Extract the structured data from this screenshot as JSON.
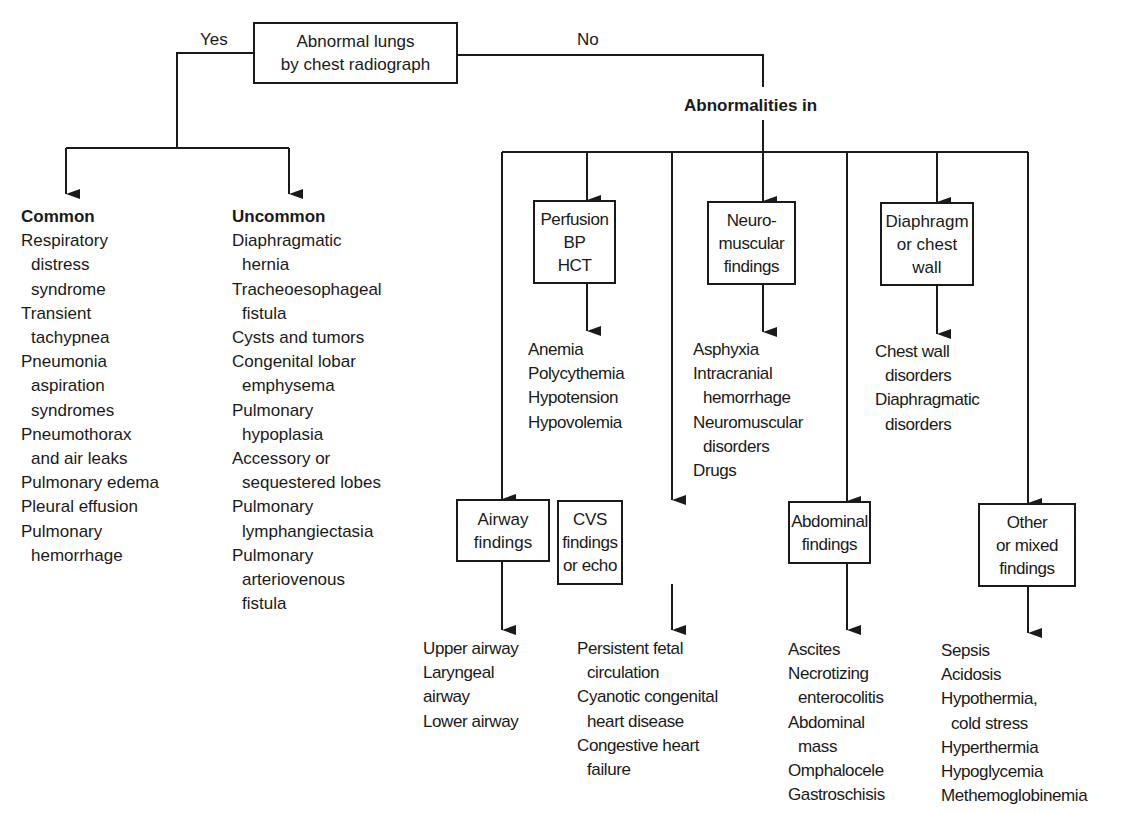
{
  "root": {
    "label_lines": [
      "Abnormal lungs",
      "by chest radiograph"
    ],
    "yes_label": "Yes",
    "no_label": "No"
  },
  "yes_branch": {
    "common": {
      "heading": "Common",
      "items": [
        {
          "main": "Respiratory",
          "cont": [
            "distress",
            "syndrome"
          ]
        },
        {
          "main": "Transient",
          "cont": [
            "tachypnea"
          ]
        },
        {
          "main": "Pneumonia",
          "cont": [
            "aspiration",
            "syndromes"
          ]
        },
        {
          "main": "Pneumothorax",
          "cont": [
            "and air leaks"
          ]
        },
        {
          "main": "Pulmonary edema",
          "cont": []
        },
        {
          "main": "Pleural effusion",
          "cont": []
        },
        {
          "main": "Pulmonary",
          "cont": [
            "hemorrhage"
          ]
        }
      ]
    },
    "uncommon": {
      "heading": "Uncommon",
      "items": [
        {
          "main": "Diaphragmatic",
          "cont": [
            "hernia"
          ]
        },
        {
          "main": "Tracheoesophageal",
          "cont": [
            "fistula"
          ]
        },
        {
          "main": "Cysts and tumors",
          "cont": []
        },
        {
          "main": "Congenital lobar",
          "cont": [
            "emphysema"
          ]
        },
        {
          "main": "Pulmonary",
          "cont": [
            "hypoplasia"
          ]
        },
        {
          "main": "Accessory or",
          "cont": [
            "sequestered lobes"
          ]
        },
        {
          "main": "Pulmonary",
          "cont": [
            "lymphangiectasia"
          ]
        },
        {
          "main": "Pulmonary",
          "cont": [
            "arteriovenous",
            "fistula"
          ]
        }
      ]
    }
  },
  "no_branch": {
    "heading": "Abnormalities in",
    "categories": [
      {
        "id": "perfusion",
        "box_lines": [
          "Perfusion",
          "BP",
          "HCT"
        ],
        "items": [
          {
            "main": "Anemia",
            "cont": []
          },
          {
            "main": "Polycythemia",
            "cont": []
          },
          {
            "main": "Hypotension",
            "cont": []
          },
          {
            "main": "Hypovolemia",
            "cont": []
          }
        ]
      },
      {
        "id": "neuromuscular",
        "box_lines": [
          "Neuro-",
          "muscular",
          "findings"
        ],
        "items": [
          {
            "main": "Asphyxia",
            "cont": []
          },
          {
            "main": "Intracranial",
            "cont": [
              "hemorrhage"
            ]
          },
          {
            "main": "Neuromuscular",
            "cont": [
              "disorders"
            ]
          },
          {
            "main": "Drugs",
            "cont": []
          }
        ]
      },
      {
        "id": "diaphragm",
        "box_lines": [
          "Diaphragm",
          "or chest",
          "wall"
        ],
        "items": [
          {
            "main": "Chest wall",
            "cont": [
              "disorders"
            ]
          },
          {
            "main": "Diaphragmatic",
            "cont": [
              "disorders"
            ]
          }
        ]
      },
      {
        "id": "airway",
        "box_lines": [
          "Airway",
          "findings"
        ],
        "items": [
          {
            "main": "Upper airway",
            "cont": []
          },
          {
            "main": "Laryngeal",
            "cont": []
          },
          {
            "main": "airway",
            "cont": []
          },
          {
            "main": "Lower airway",
            "cont": []
          }
        ]
      },
      {
        "id": "cvs",
        "box_lines": [
          "CVS",
          "findings",
          "or echo"
        ],
        "items": [
          {
            "main": "Persistent fetal",
            "cont": [
              "circulation"
            ]
          },
          {
            "main": "Cyanotic congenital",
            "cont": [
              "heart disease"
            ]
          },
          {
            "main": "Congestive heart",
            "cont": [
              "failure"
            ]
          }
        ]
      },
      {
        "id": "abdominal",
        "box_lines": [
          "Abdominal",
          "findings"
        ],
        "items": [
          {
            "main": "Ascites",
            "cont": []
          },
          {
            "main": "Necrotizing",
            "cont": [
              "enterocolitis"
            ]
          },
          {
            "main": "Abdominal",
            "cont": [
              "mass"
            ]
          },
          {
            "main": "Omphalocele",
            "cont": []
          },
          {
            "main": "Gastroschisis",
            "cont": []
          }
        ]
      },
      {
        "id": "other",
        "box_lines": [
          "Other",
          "or mixed",
          "findings"
        ],
        "items": [
          {
            "main": "Sepsis",
            "cont": []
          },
          {
            "main": "Acidosis",
            "cont": []
          },
          {
            "main": "Hypothermia,",
            "cont": [
              "cold stress"
            ]
          },
          {
            "main": "Hyperthermia",
            "cont": []
          },
          {
            "main": "Hypoglycemia",
            "cont": []
          },
          {
            "main": "Methemoglobinemia",
            "cont": []
          }
        ]
      }
    ]
  },
  "colors": {
    "line": "#1a1a1a",
    "background": "#ffffff"
  }
}
